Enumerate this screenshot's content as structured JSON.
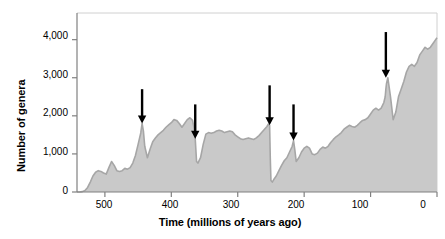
{
  "chart_data": {
    "type": "area",
    "title": "",
    "xlabel": "Time (millions of years ago)",
    "ylabel": "Number of genera",
    "xlim": [
      542,
      0
    ],
    "ylim": [
      0,
      4700
    ],
    "x_reversed": true,
    "grid": false,
    "legend": null,
    "xticks": [
      500,
      400,
      300,
      200,
      100,
      0
    ],
    "xtick_labels": [
      "500",
      "400",
      "300",
      "200",
      "100",
      "0"
    ],
    "yticks": [
      0,
      1000,
      2000,
      3000,
      4000
    ],
    "ytick_labels": [
      "0",
      "1,000",
      "2,000",
      "3,000",
      "4,000"
    ],
    "fill_color": "#c9c9c9",
    "line_color": "#a6a6a6",
    "axis_color": "#808080",
    "arrow_color": "#000000",
    "annotations": [
      {
        "name": "end-ordovician-extinction-arrow",
        "x": 444,
        "y_top": 2700,
        "y_tip": 1800
      },
      {
        "name": "late-devonian-extinction-arrow",
        "x": 364,
        "y_top": 2300,
        "y_tip": 1400
      },
      {
        "name": "end-permian-extinction-arrow",
        "x": 252,
        "y_top": 2800,
        "y_tip": 1750
      },
      {
        "name": "end-triassic-extinction-arrow",
        "x": 216,
        "y_top": 2300,
        "y_tip": 1350
      },
      {
        "name": "end-cretaceous-extinction-arrow",
        "x": 77,
        "y_top": 4200,
        "y_tip": 3000
      }
    ],
    "x": [
      542,
      538,
      534,
      530,
      526,
      522,
      518,
      514,
      510,
      506,
      502,
      498,
      494,
      490,
      486,
      482,
      478,
      474,
      470,
      466,
      462,
      458,
      454,
      450,
      446,
      444,
      442,
      440,
      436,
      432,
      428,
      424,
      420,
      416,
      412,
      408,
      404,
      400,
      396,
      392,
      388,
      384,
      380,
      376,
      372,
      368,
      366,
      364,
      362,
      360,
      356,
      352,
      348,
      344,
      340,
      336,
      332,
      328,
      324,
      320,
      316,
      312,
      308,
      304,
      300,
      296,
      292,
      288,
      284,
      280,
      276,
      272,
      268,
      264,
      260,
      256,
      254,
      252,
      251,
      250,
      248,
      246,
      242,
      238,
      234,
      230,
      226,
      222,
      218,
      216,
      214,
      212,
      208,
      204,
      200,
      196,
      192,
      188,
      184,
      180,
      176,
      172,
      168,
      164,
      160,
      156,
      152,
      148,
      144,
      140,
      136,
      132,
      128,
      124,
      120,
      116,
      112,
      108,
      104,
      100,
      96,
      92,
      88,
      84,
      80,
      78,
      77,
      76,
      74,
      70,
      66,
      62,
      58,
      54,
      50,
      46,
      42,
      38,
      34,
      30,
      26,
      22,
      18,
      14,
      10,
      6,
      2,
      0
    ],
    "y": [
      0,
      0,
      10,
      40,
      120,
      260,
      420,
      520,
      560,
      540,
      500,
      470,
      640,
      800,
      700,
      560,
      540,
      560,
      620,
      600,
      640,
      760,
      960,
      1250,
      1550,
      1800,
      1600,
      1200,
      900,
      1120,
      1320,
      1420,
      1500,
      1560,
      1620,
      1700,
      1760,
      1820,
      1900,
      1880,
      1800,
      1700,
      1800,
      1900,
      1950,
      1880,
      1700,
      1400,
      800,
      760,
      900,
      1250,
      1520,
      1560,
      1540,
      1560,
      1600,
      1620,
      1600,
      1560,
      1580,
      1600,
      1580,
      1500,
      1450,
      1400,
      1380,
      1400,
      1420,
      1400,
      1380,
      1420,
      1480,
      1560,
      1640,
      1720,
      1780,
      1750,
      900,
      300,
      260,
      320,
      420,
      560,
      700,
      820,
      900,
      1050,
      1200,
      1350,
      1100,
      800,
      900,
      1050,
      1150,
      1200,
      1150,
      1000,
      980,
      1020,
      1120,
      1180,
      1150,
      1200,
      1300,
      1380,
      1450,
      1500,
      1560,
      1650,
      1700,
      1750,
      1720,
      1700,
      1750,
      1820,
      1880,
      1900,
      1950,
      2050,
      2150,
      2200,
      2150,
      2200,
      2350,
      2500,
      2700,
      2850,
      3000,
      2500,
      1900,
      2100,
      2500,
      2700,
      2900,
      3150,
      3300,
      3350,
      3300,
      3400,
      3600,
      3700,
      3800,
      3750,
      3800,
      3900,
      4000,
      4050,
      4150,
      4350,
      4600
    ]
  }
}
